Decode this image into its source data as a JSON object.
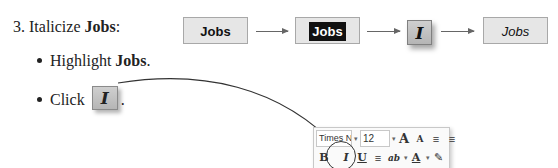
{
  "instructions": {
    "step_number": "3.",
    "step_text": "Italicize ",
    "step_target": "Jobs",
    "step_suffix": ":",
    "bullets": [
      {
        "prefix": "Highlight ",
        "target": "Jobs",
        "suffix": "."
      },
      {
        "prefix": "Click ",
        "icon": "italic-icon",
        "suffix": "."
      }
    ]
  },
  "flow": {
    "boxes": [
      {
        "label": "Jobs",
        "state": "normal"
      },
      {
        "label": "Jobs",
        "state": "highlighted"
      },
      {
        "label": "I",
        "state": "italic-button"
      },
      {
        "label": "Jobs",
        "state": "italicized"
      }
    ]
  },
  "toolbar": {
    "font_name": "Times Ne",
    "font_size": "12",
    "grow_font": "A",
    "shrink_font": "A",
    "bold": "B",
    "italic": "I",
    "underline": "U",
    "highlight": "ab",
    "font_color": "A",
    "dropdown": "▾"
  },
  "colors": {
    "box_fill": "#e6e6e6",
    "box_border": "#a8a8a8",
    "highlight_fill": "#111111",
    "arrow": "#666666"
  }
}
